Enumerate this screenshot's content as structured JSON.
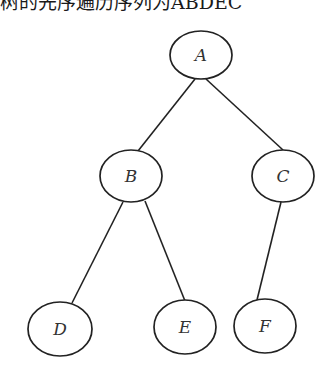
{
  "caption": {
    "text": "树的先序遍历序列为ABDEC"
  },
  "diagram": {
    "type": "binary-tree",
    "nodes": [
      {
        "id": "A",
        "label": "A",
        "cx": 201,
        "cy": 55,
        "rx": 31,
        "ry": 24
      },
      {
        "id": "B",
        "label": "B",
        "cx": 131,
        "cy": 176,
        "rx": 31,
        "ry": 26
      },
      {
        "id": "C",
        "label": "C",
        "cx": 283,
        "cy": 176,
        "rx": 31,
        "ry": 26
      },
      {
        "id": "D",
        "label": "D",
        "cx": 60,
        "cy": 329,
        "rx": 32,
        "ry": 27
      },
      {
        "id": "E",
        "label": "E",
        "cx": 185,
        "cy": 327,
        "rx": 31,
        "ry": 27
      },
      {
        "id": "F",
        "label": "F",
        "cx": 265,
        "cy": 326,
        "rx": 31,
        "ry": 27
      }
    ],
    "edges": [
      {
        "from": "A",
        "to": "B"
      },
      {
        "from": "A",
        "to": "C"
      },
      {
        "from": "B",
        "to": "D"
      },
      {
        "from": "B",
        "to": "E"
      },
      {
        "from": "C",
        "to": "F"
      }
    ],
    "colors": {
      "stroke": "#222222",
      "label": "#333333",
      "background": "#ffffff"
    }
  }
}
